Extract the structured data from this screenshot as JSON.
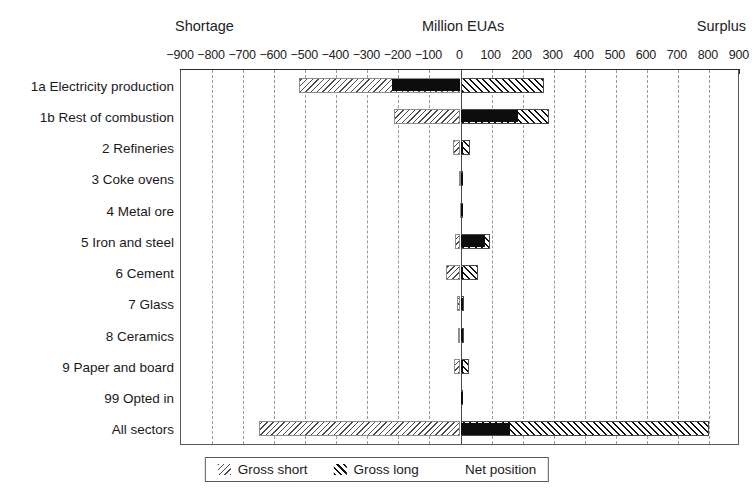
{
  "header": {
    "left_label": "Shortage",
    "center_label": "Million EUAs",
    "right_label": "Surplus"
  },
  "legend": {
    "position": "bottom-center",
    "items": [
      {
        "key": "gross_short",
        "label": "Gross short",
        "swatch": "light-backslash-hatch"
      },
      {
        "key": "gross_long",
        "label": "Gross long",
        "swatch": "dark-forwardslash-hatch"
      },
      {
        "key": "net_position",
        "label": "Net position",
        "swatch": "solid-black-square"
      }
    ]
  },
  "chart_data": {
    "type": "bar",
    "orientation": "horizontal",
    "title": "Million EUAs",
    "xlabel": "Million EUAs",
    "ylabel": "",
    "xlim": [
      -900,
      900
    ],
    "grid": true,
    "xticks": [
      -900,
      -800,
      -700,
      -600,
      -500,
      -400,
      -300,
      -200,
      -100,
      0,
      100,
      200,
      300,
      400,
      500,
      600,
      700,
      800,
      900
    ],
    "xticklabels": [
      "−900",
      "−800",
      "−700",
      "−600",
      "−500",
      "−400",
      "−300",
      "−200",
      "−100",
      "0",
      "100",
      "200",
      "300",
      "400",
      "500",
      "600",
      "700",
      "800",
      "900"
    ],
    "categories": [
      "1a Electricity production",
      "1b Rest of combustion",
      "2 Refineries",
      "3 Coke ovens",
      "4 Metal ore",
      "5 Iron and steel",
      "6 Cement",
      "7 Glass",
      "8 Ceramics",
      "9 Paper and board",
      "99 Opted in",
      "All sectors"
    ],
    "series": [
      {
        "name": "Gross short",
        "values": [
          -520,
          -215,
          -25,
          -6,
          -3,
          -18,
          -48,
          -10,
          -8,
          -22,
          0,
          -650
        ]
      },
      {
        "name": "Gross long",
        "values": [
          270,
          285,
          32,
          8,
          4,
          95,
          55,
          12,
          10,
          28,
          2,
          800
        ]
      },
      {
        "name": "Net position",
        "values": [
          -220,
          185,
          8,
          2,
          1,
          78,
          7,
          2,
          2,
          6,
          1,
          160
        ]
      }
    ]
  }
}
